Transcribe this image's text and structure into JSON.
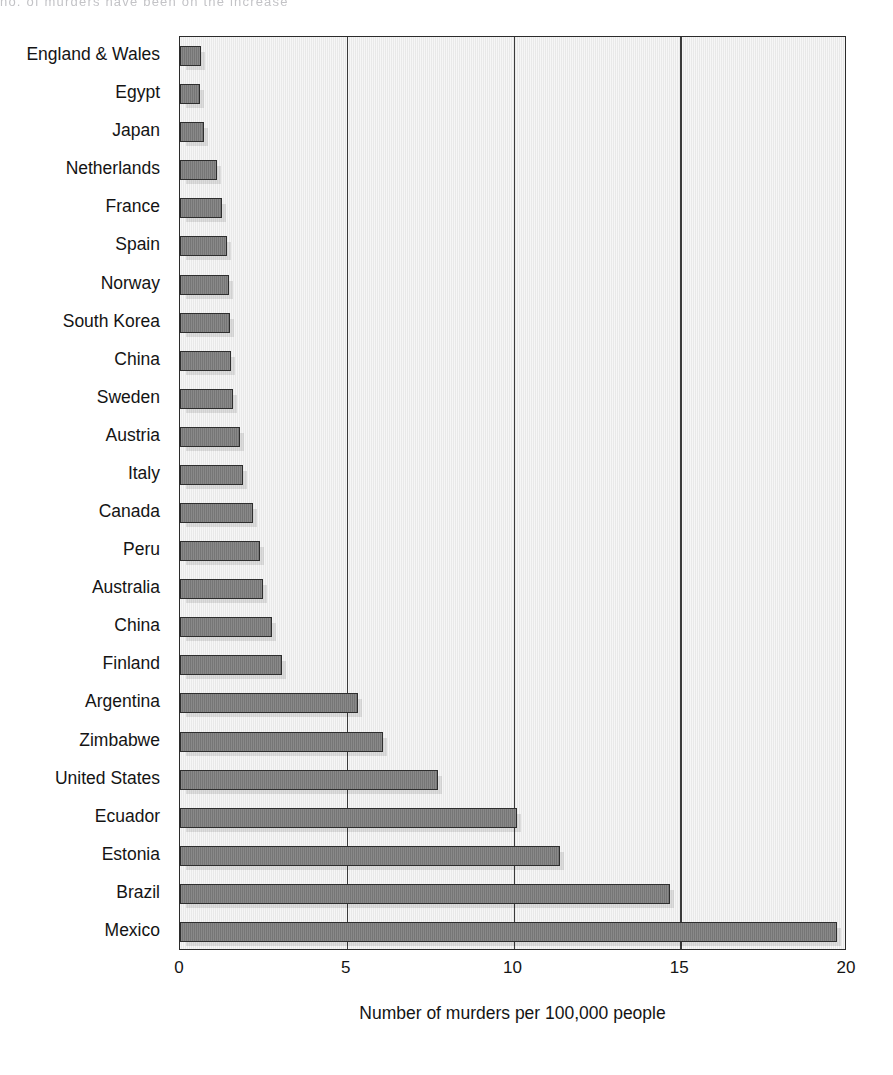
{
  "page": {
    "top_cut_text": "no. of murders have been on the increase"
  },
  "chart_data": {
    "type": "bar",
    "orientation": "horizontal",
    "title": "",
    "xlabel": "Number of murders per 100,000 people",
    "ylabel": "",
    "xlim": [
      0,
      20
    ],
    "xticks": [
      0,
      5,
      10,
      15,
      20
    ],
    "xticklabels": [
      "0",
      "5",
      "10",
      "15",
      "20"
    ],
    "grid": "vertical",
    "legend": "none",
    "bar_color": "#7c7c7c",
    "bar_edge_color": "#2e2e2e",
    "plot_background": "#ececec",
    "axis_color": "#2b2b2b",
    "categories": [
      "England & Wales",
      "Egypt",
      "Japan",
      "Netherlands",
      "France",
      "Spain",
      "Norway",
      "South Korea",
      "China",
      "Sweden",
      "Austria",
      "Italy",
      "Canada",
      "Peru",
      "Australia",
      "China",
      "Finland",
      "Argentina",
      "Zimbabwe",
      "United States",
      "Ecuador",
      "Estonia",
      "Brazil",
      "Mexico"
    ],
    "values": [
      0.63,
      0.6,
      0.72,
      1.1,
      1.25,
      1.4,
      1.48,
      1.5,
      1.52,
      1.6,
      1.8,
      1.9,
      2.2,
      2.4,
      2.5,
      2.75,
      3.05,
      5.35,
      6.1,
      7.75,
      10.1,
      11.4,
      14.7,
      19.7
    ]
  }
}
